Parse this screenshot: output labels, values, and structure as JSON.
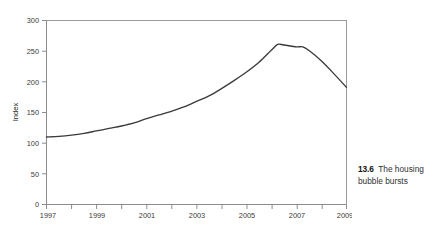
{
  "figure": {
    "caption_number": "13.6",
    "caption_text": "The housing bubble bursts",
    "cropped_heading": ""
  },
  "colors": {
    "line": "#3a3a3a",
    "axis": "#8c8c8c",
    "tick_text": "#3b3b3b",
    "caption_number": "#111111",
    "caption_text": "#2f2f2f",
    "background": "#ffffff"
  },
  "chart_data": {
    "type": "line",
    "title": "",
    "subtitle": "",
    "xlabel": "",
    "ylabel": "Index",
    "xlim": [
      1997,
      2009
    ],
    "ylim": [
      0,
      300
    ],
    "grid": false,
    "legend": "none",
    "y_ticks": [
      0,
      50,
      100,
      150,
      200,
      250,
      300
    ],
    "y_tick_labels": [
      "0",
      "50",
      "100",
      "150",
      "200",
      "250",
      "300"
    ],
    "x_ticks": [
      1997,
      1998,
      1999,
      2000,
      2001,
      2002,
      2003,
      2004,
      2005,
      2006,
      2007,
      2008,
      2009
    ],
    "x_tick_labels": [
      "1997",
      "",
      "1999",
      "",
      "2001",
      "",
      "2003",
      "",
      "2005",
      "",
      "2007",
      "",
      "2009"
    ],
    "series": [
      {
        "name": "Index",
        "x": [
          1997.0,
          1997.5,
          1998.0,
          1998.5,
          1999.0,
          1999.5,
          2000.0,
          2000.5,
          2001.0,
          2001.5,
          2002.0,
          2002.5,
          2003.0,
          2003.5,
          2004.0,
          2004.5,
          2005.0,
          2005.5,
          2006.0,
          2006.25,
          2006.5,
          2007.0,
          2007.25,
          2007.5,
          2008.0,
          2008.5,
          2009.0
        ],
        "values": [
          110,
          111,
          113,
          116,
          120,
          124,
          128,
          133,
          140,
          146,
          152,
          159,
          168,
          177,
          189,
          202,
          216,
          232,
          252,
          261,
          260,
          257,
          257,
          251,
          234,
          213,
          191
        ]
      }
    ],
    "annotations": []
  }
}
